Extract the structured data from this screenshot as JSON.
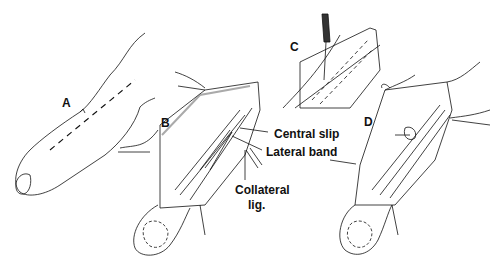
{
  "figure": {
    "panels": [
      {
        "id": "A",
        "label": "A",
        "x": 62,
        "y": 96
      },
      {
        "id": "B",
        "label": "B",
        "x": 161,
        "y": 116
      },
      {
        "id": "C",
        "label": "C",
        "x": 290,
        "y": 40
      },
      {
        "id": "D",
        "label": "D",
        "x": 364,
        "y": 115
      }
    ],
    "annotations": [
      {
        "id": "central-slip",
        "text": "Central slip",
        "x": 274,
        "y": 128
      },
      {
        "id": "lateral-band",
        "text": "Lateral band",
        "x": 266,
        "y": 146
      },
      {
        "id": "collateral-lig-1",
        "text": "Collateral",
        "x": 235,
        "y": 184
      },
      {
        "id": "collateral-lig-2",
        "text": "lig.",
        "x": 248,
        "y": 199
      }
    ],
    "colors": {
      "ink": "#111111",
      "background": "#ffffff",
      "shade": "#555555"
    }
  }
}
